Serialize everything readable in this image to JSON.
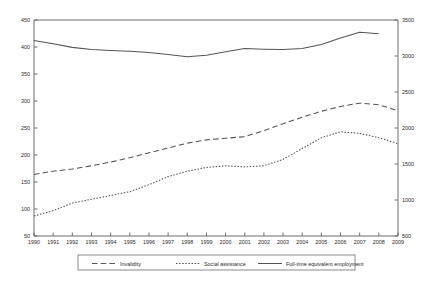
{
  "chart_data": {
    "type": "line",
    "title": "",
    "xlabel": "",
    "ylabel": "",
    "grid": false,
    "legend_position": "bottom",
    "x": [
      1990,
      1991,
      1992,
      1993,
      1994,
      1995,
      1996,
      1997,
      1998,
      1999,
      2000,
      2001,
      2002,
      2003,
      2004,
      2005,
      2006,
      2007,
      2008,
      2009
    ],
    "x_tick_labels": [
      "1990",
      "1991",
      "1992",
      "1993",
      "1994",
      "1995",
      "1996",
      "1997",
      "1998",
      "1999",
      "2000",
      "2001",
      "2002",
      "2003",
      "2004",
      "2005",
      "2006",
      "2007",
      "2008",
      "2009"
    ],
    "left_axis": {
      "ylim": [
        50,
        450
      ],
      "ticks": [
        50,
        100,
        150,
        200,
        250,
        300,
        350,
        400,
        450
      ],
      "tick_labels": [
        "50",
        "100",
        "150",
        "200",
        "250",
        "300",
        "350",
        "400",
        "450"
      ]
    },
    "right_axis": {
      "ylim": [
        500,
        3500
      ],
      "ticks": [
        500,
        1000,
        1500,
        2000,
        2500,
        3000,
        3500
      ],
      "tick_labels": [
        "500",
        "1000",
        "1500",
        "2000",
        "2500",
        "3000",
        "3500"
      ]
    },
    "series": [
      {
        "name": "Invalidity",
        "axis": "left",
        "style": "dashed",
        "color": "#555555",
        "values": [
          164,
          170,
          174,
          180,
          187,
          195,
          204,
          213,
          222,
          228,
          231,
          234,
          245,
          258,
          270,
          281,
          290,
          296,
          293,
          282
        ]
      },
      {
        "name": "Social assistance",
        "axis": "left",
        "style": "dotted",
        "color": "#555555",
        "values": [
          87,
          97,
          111,
          118,
          125,
          132,
          145,
          160,
          170,
          177,
          180,
          178,
          180,
          192,
          212,
          232,
          243,
          240,
          232,
          221
        ]
      },
      {
        "name": "Full-time equivalent employment",
        "axis": "right",
        "style": "solid",
        "color": "#555555",
        "values": [
          3215,
          3170,
          3120,
          3090,
          3075,
          3065,
          3050,
          3020,
          2990,
          3010,
          3060,
          3105,
          3095,
          3090,
          3105,
          3160,
          3250,
          3330,
          3310,
          null
        ]
      }
    ]
  },
  "legend": {
    "entries": [
      {
        "label": "Invalidity"
      },
      {
        "label": "Social assistance"
      },
      {
        "label": "Full-time equivalent employment"
      }
    ]
  }
}
